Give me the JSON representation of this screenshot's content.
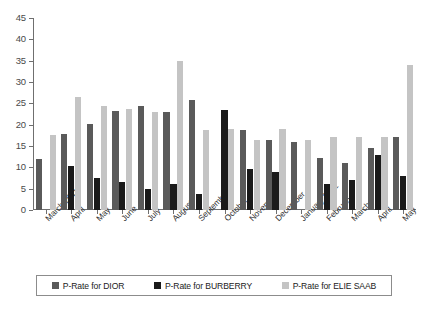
{
  "chart_data": {
    "type": "bar",
    "title": "",
    "subtitle": "",
    "xlabel": "",
    "ylabel": "",
    "ylim": [
      0,
      45
    ],
    "ytick_step": 5,
    "yticks": [
      0,
      5,
      10,
      15,
      20,
      25,
      30,
      35,
      40,
      45
    ],
    "grid": false,
    "legend_position": "bottom",
    "categories": [
      "March 2011",
      "April",
      "May",
      "June",
      "July",
      "August",
      "September",
      "October",
      "November",
      "December",
      "January 2012",
      "February",
      "March",
      "April",
      "May"
    ],
    "series": [
      {
        "name": "P-Rate for DIOR",
        "color": "#5a5a5a",
        "values": [
          12.0,
          17.8,
          20.2,
          23.1,
          24.4,
          23.0,
          25.8,
          null,
          18.8,
          16.3,
          16.0,
          12.3,
          11.0,
          14.5,
          17.0
        ]
      },
      {
        "name": "P-Rate for BURBERRY",
        "color": "#1a1a1a",
        "values": [
          null,
          10.2,
          7.5,
          6.5,
          5.0,
          6.2,
          3.7,
          23.5,
          9.5,
          9.0,
          null,
          6.0,
          7.0,
          13.0,
          8.0
        ]
      },
      {
        "name": "P-Rate for ELIE SAAB",
        "color": "#c4c4c4",
        "values": [
          17.5,
          26.5,
          24.4,
          23.7,
          23.0,
          35.0,
          18.7,
          19.0,
          16.3,
          19.0,
          16.3,
          17.0,
          17.0,
          17.0,
          34.0
        ]
      }
    ]
  },
  "legend": {
    "items": [
      {
        "label": "P-Rate for DIOR",
        "color": "#5a5a5a"
      },
      {
        "label": "P-Rate for BURBERRY",
        "color": "#1a1a1a"
      },
      {
        "label": "P-Rate for ELIE SAAB",
        "color": "#c4c4c4"
      }
    ]
  }
}
